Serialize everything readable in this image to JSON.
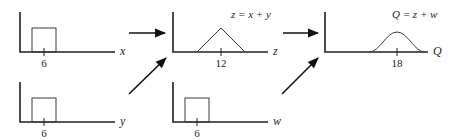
{
  "panels": {
    "x": {
      "axis_label": "x",
      "tick_label": "6",
      "shape": "uniform-rectangle"
    },
    "y": {
      "axis_label": "y",
      "tick_label": "6",
      "shape": "uniform-rectangle"
    },
    "z": {
      "axis_label": "z",
      "tick_label": "12",
      "shape": "triangle",
      "formula": "z = x + y"
    },
    "w": {
      "axis_label": "w",
      "tick_label": "6",
      "shape": "uniform-rectangle"
    },
    "q": {
      "axis_label": "Q",
      "tick_label": "18",
      "shape": "bell-curve",
      "formula": "Q = z + w"
    }
  },
  "flow": [
    {
      "from": "x",
      "to": "z"
    },
    {
      "from": "y",
      "to": "z"
    },
    {
      "from": "z",
      "to": "Q"
    },
    {
      "from": "w",
      "to": "Q"
    }
  ]
}
